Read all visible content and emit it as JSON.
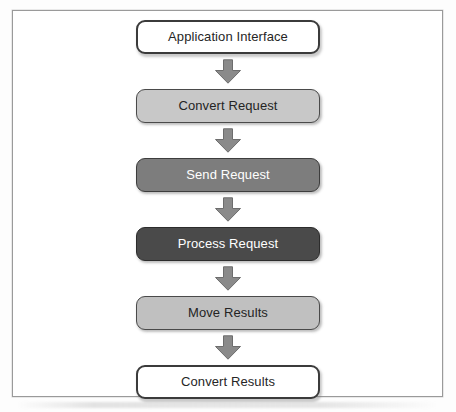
{
  "diagram": {
    "type": "flowchart",
    "orientation": "vertical-top-to-bottom",
    "frame_border_color": "#9a9a9a",
    "background_color": "#ffffff",
    "arrow_color": "#8a8a8a",
    "arrow_border_color": "#6b6b6b",
    "nodes": [
      {
        "id": "application-interface",
        "label": "Application Interface",
        "style": "outline",
        "fill": "#ffffff",
        "text_color": "#262626",
        "border_color": "#3b3b3b"
      },
      {
        "id": "convert-request",
        "label": "Convert Request",
        "style": "light",
        "fill": "#c8c8c8",
        "text_color": "#242424",
        "border_color": "#4a4a4a"
      },
      {
        "id": "send-request",
        "label": "Send Request",
        "style": "mid",
        "fill": "#7d7d7d",
        "text_color": "#ffffff",
        "border_color": "#3d3d3d"
      },
      {
        "id": "process-request",
        "label": "Process Request",
        "style": "dark",
        "fill": "#4a4a4a",
        "text_color": "#ffffff",
        "border_color": "#2c2c2c"
      },
      {
        "id": "move-results",
        "label": "Move Results",
        "style": "light",
        "fill": "#c0c0c0",
        "text_color": "#242424",
        "border_color": "#4a4a4a"
      },
      {
        "id": "convert-results",
        "label": "Convert Results",
        "style": "outline",
        "fill": "#ffffff",
        "text_color": "#262626",
        "border_color": "#3b3b3b"
      }
    ],
    "connectors": [
      {
        "id": "arrow-1",
        "from": "application-interface",
        "to": "convert-request",
        "icon": "arrow-down-icon"
      },
      {
        "id": "arrow-2",
        "from": "convert-request",
        "to": "send-request",
        "icon": "arrow-down-icon"
      },
      {
        "id": "arrow-3",
        "from": "send-request",
        "to": "process-request",
        "icon": "arrow-down-icon"
      },
      {
        "id": "arrow-4",
        "from": "process-request",
        "to": "move-results",
        "icon": "arrow-down-icon"
      },
      {
        "id": "arrow-5",
        "from": "move-results",
        "to": "convert-results",
        "icon": "arrow-down-icon"
      }
    ]
  }
}
